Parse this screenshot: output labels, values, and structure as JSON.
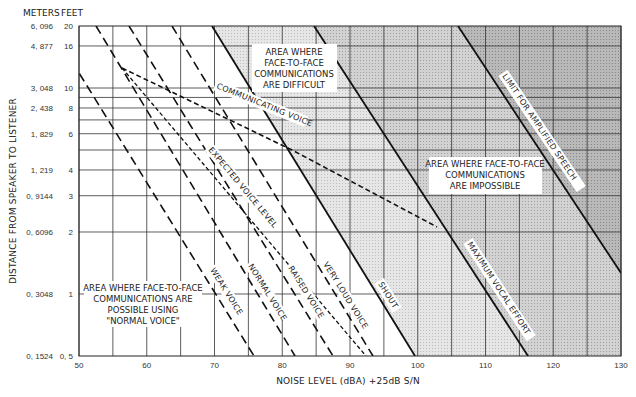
{
  "chart_data": {
    "type": "line",
    "title": "",
    "xlabel": "NOISE LEVEL (dBA) +25dB S/N",
    "ylabel": "DISTANCE FROM SPEAKER TO LISTENER",
    "x_scale": "linear",
    "y_scale": "log",
    "xlim": [
      50,
      130
    ],
    "ylim_feet": [
      0.5,
      20
    ],
    "grid": true,
    "x_ticks": [
      50,
      60,
      70,
      80,
      90,
      100,
      110,
      120,
      130
    ],
    "x_minor_gridlines": [
      55,
      65,
      75,
      85,
      95,
      105,
      115,
      125
    ],
    "y_ticks": [
      {
        "feet": "20",
        "meters": "6, 096"
      },
      {
        "feet": "16",
        "meters": "4, 877"
      },
      {
        "feet": "10",
        "meters": "3, 048"
      },
      {
        "feet": "8",
        "meters": "2, 438"
      },
      {
        "feet": "6",
        "meters": "1, 829"
      },
      {
        "feet": "4",
        "meters": "1, 219"
      },
      {
        "feet": "3",
        "meters": "0, 9144"
      },
      {
        "feet": "2",
        "meters": "0, 6096"
      },
      {
        "feet": "1",
        "meters": "0, 3048"
      },
      {
        "feet": "0, 5",
        "meters": "0, 1524"
      }
    ],
    "y_gridlines_feet": [
      16,
      10,
      9,
      8,
      7,
      6,
      5,
      4,
      3,
      2,
      1
    ],
    "y_unit_headers": {
      "meters": "METERS",
      "feet": "FEET"
    },
    "series": [
      {
        "name": "WEAK VOICE",
        "style": "long-dash",
        "points_dBA_ft": [
          [
            50,
            9.2
          ],
          [
            75.8,
            0.5
          ]
        ]
      },
      {
        "name": "NORMAL VOICE",
        "style": "long-dash",
        "points_dBA_ft": [
          [
            52.5,
            20
          ],
          [
            81.9,
            0.5
          ]
        ]
      },
      {
        "name": "RAISED VOICE",
        "style": "long-dash",
        "points_dBA_ft": [
          [
            57.4,
            20
          ],
          [
            87.5,
            0.5
          ]
        ]
      },
      {
        "name": "VERY LOUD VOICE",
        "style": "long-dash",
        "points_dBA_ft": [
          [
            63.7,
            20
          ],
          [
            93.4,
            0.5
          ]
        ]
      },
      {
        "name": "SHOUT",
        "style": "solid",
        "points_dBA_ft": [
          [
            69.6,
            20
          ],
          [
            99.6,
            0.5
          ]
        ]
      },
      {
        "name": "MAXIMUM VOCAL EFFORT",
        "style": "solid",
        "points_dBA_ft": [
          [
            84.7,
            20
          ],
          [
            116.3,
            0.5
          ]
        ]
      },
      {
        "name": "LIMIT FOR AMPLIFIED SPEECH",
        "style": "solid",
        "points_dBA_ft": [
          [
            105.9,
            20
          ],
          [
            130,
            1.3
          ]
        ]
      },
      {
        "name": "EXPECTED VOICE LEVEL",
        "style": "short-dash",
        "points_dBA_ft": [
          [
            56.3,
            12.6
          ],
          [
            93,
            0.5
          ]
        ]
      },
      {
        "name": "COMMUNICATING VOICE",
        "style": "short-dash",
        "points_dBA_ft": [
          [
            56.3,
            12.6
          ],
          [
            81.4,
            5.0
          ],
          [
            102.8,
            2.2
          ]
        ]
      }
    ],
    "annotations": [
      {
        "text": [
          "AREA WHERE",
          "FACE-TO-FACE",
          "COMMUNICATIONS",
          "ARE DIFFICULT"
        ]
      },
      {
        "text": [
          "AREA WHERE FACE-TO-FACE",
          "COMMUNICATIONS",
          "ARE IMPOSSIBLE"
        ]
      },
      {
        "text": [
          "AREA WHERE FACE-TO-FACE",
          "COMMUNICATIONS ARE",
          "POSSIBLE USING",
          "\"NORMAL VOICE\""
        ]
      }
    ],
    "regions": [
      {
        "name": "possible",
        "bounded_right_by": "SHOUT",
        "fill": "#ffffff"
      },
      {
        "name": "difficult",
        "between": [
          "SHOUT",
          "MAXIMUM VOCAL EFFORT"
        ],
        "fill": "#e2e2e2"
      },
      {
        "name": "impossible",
        "between": [
          "MAXIMUM VOCAL EFFORT",
          "LIMIT FOR AMPLIFIED SPEECH"
        ],
        "fill": "#cfcfcf"
      },
      {
        "name": "beyond-amplified",
        "bounded_left_by": "LIMIT FOR AMPLIFIED SPEECH",
        "fill": "#b4b4b4"
      }
    ]
  },
  "labels": {
    "meters_head": "METERS",
    "feet_head": "FEET",
    "y_title": "DISTANCE FROM SPEAKER TO LISTENER",
    "x_title": "NOISE LEVEL (dBA)  +25dB  S/N",
    "weak": "WEAK VOICE",
    "normal": "NORMAL VOICE",
    "raised": "RAISED VOICE",
    "very_loud": "VERY LOUD VOICE",
    "shout": "SHOUT",
    "max_effort": "MAXIMUM VOCAL EFFORT",
    "limit": "LIMIT FOR AMPLIFIED SPEECH",
    "expected": "EXPECTED VOICE LEVEL",
    "communicating": "COMMUNICATING VOICE",
    "difficult": [
      "AREA WHERE",
      "FACE-TO-FACE",
      "COMMUNICATIONS",
      "ARE DIFFICULT"
    ],
    "impossible": [
      "AREA WHERE FACE-TO-FACE",
      "COMMUNICATIONS",
      "ARE IMPOSSIBLE"
    ],
    "possible": [
      "AREA WHERE FACE-TO-FACE",
      "COMMUNICATIONS ARE",
      "POSSIBLE USING",
      "\"NORMAL VOICE\""
    ]
  },
  "colors": {
    "difficult": "#e3e3e3",
    "impossible": "#cdcdcd",
    "beyond": "#b2b2b2",
    "grid": "#333333",
    "line": "#111111"
  }
}
